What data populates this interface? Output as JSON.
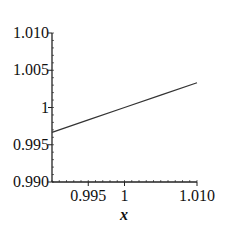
{
  "chart_data": {
    "type": "line",
    "title": "",
    "xlabel": "x",
    "ylabel": "",
    "xlim": [
      0.99,
      1.01
    ],
    "ylim": [
      0.99,
      1.01
    ],
    "grid": false,
    "legend": null,
    "x_ticks": [
      {
        "value": 0.995,
        "label": "0.995"
      },
      {
        "value": 1.0,
        "label": "1"
      },
      {
        "value": 1.01,
        "label": "1.010"
      }
    ],
    "y_ticks": [
      {
        "value": 0.99,
        "label": "0.990"
      },
      {
        "value": 0.995,
        "label": "0.995"
      },
      {
        "value": 1.0,
        "label": "1"
      },
      {
        "value": 1.005,
        "label": "1.005"
      },
      {
        "value": 1.01,
        "label": "1.010"
      }
    ],
    "series": [
      {
        "name": "f(x)",
        "color": "#333333",
        "x": [
          0.99,
          0.995,
          1.0,
          1.005,
          1.01
        ],
        "y": [
          0.99666,
          0.99833,
          1.0,
          1.00166,
          1.00332
        ]
      }
    ]
  }
}
